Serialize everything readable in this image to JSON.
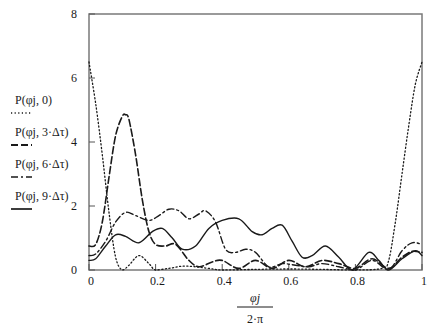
{
  "chart_data": {
    "type": "line",
    "title": "",
    "xlabel_numerator": "φj",
    "xlabel_denominator": "2·π",
    "ylabel": "",
    "xlim": [
      0,
      1
    ],
    "ylim": [
      0,
      8
    ],
    "x_ticks": [
      0,
      0.2,
      0.4,
      0.6,
      0.8,
      1
    ],
    "x_tick_labels": [
      "0",
      "0.2",
      "0.4",
      "0.6",
      "0.8",
      "1"
    ],
    "y_ticks": [
      0,
      2,
      4,
      6,
      8
    ],
    "y_tick_labels": [
      "0",
      "2",
      "4",
      "6",
      "8"
    ],
    "grid": false,
    "legend_position": "left",
    "series": [
      {
        "name": "P(φj, 0)",
        "style": "dotted",
        "x": [
          0,
          0.02,
          0.04,
          0.06,
          0.08,
          0.1,
          0.12,
          0.15,
          0.18,
          0.2,
          0.24,
          0.28,
          0.32,
          0.36,
          0.4,
          0.5,
          0.6,
          0.7,
          0.8,
          0.88,
          0.9,
          0.92,
          0.94,
          0.96,
          0.98,
          1
        ],
        "values": [
          6.5,
          5.2,
          3.6,
          1.8,
          0.4,
          0.0,
          0.15,
          0.45,
          0.2,
          0.0,
          0.05,
          0.12,
          0.1,
          0.05,
          0.0,
          0.02,
          0.03,
          0.02,
          0.0,
          0.05,
          0.3,
          1.5,
          3.0,
          4.5,
          5.8,
          6.5
        ]
      },
      {
        "name": "P(φj, 3·Δτ)",
        "style": "dashed",
        "x": [
          0,
          0.02,
          0.04,
          0.06,
          0.08,
          0.1,
          0.11,
          0.12,
          0.14,
          0.16,
          0.18,
          0.2,
          0.23,
          0.26,
          0.3,
          0.33,
          0.37,
          0.4,
          0.45,
          0.5,
          0.55,
          0.6,
          0.65,
          0.7,
          0.75,
          0.8,
          0.85,
          0.9,
          0.94,
          0.97,
          1
        ],
        "values": [
          0.75,
          0.8,
          1.5,
          2.9,
          4.2,
          4.8,
          4.85,
          4.7,
          3.6,
          2.2,
          1.2,
          0.8,
          0.75,
          0.8,
          0.3,
          0.1,
          0.25,
          0.3,
          0.05,
          0.3,
          0.05,
          0.3,
          0.1,
          0.3,
          0.2,
          0.05,
          0.35,
          0.05,
          0.4,
          0.58,
          0.55
        ]
      },
      {
        "name": "P(φj, 6·Δτ)",
        "style": "dashdot",
        "x": [
          0,
          0.02,
          0.05,
          0.08,
          0.11,
          0.14,
          0.18,
          0.21,
          0.24,
          0.27,
          0.3,
          0.33,
          0.35,
          0.38,
          0.41,
          0.44,
          0.47,
          0.5,
          0.54,
          0.58,
          0.62,
          0.66,
          0.7,
          0.75,
          0.8,
          0.85,
          0.9,
          0.94,
          0.97,
          1
        ],
        "values": [
          0.45,
          0.5,
          0.9,
          1.5,
          1.8,
          1.7,
          1.55,
          1.7,
          1.9,
          1.85,
          1.6,
          1.75,
          1.85,
          1.5,
          0.65,
          0.55,
          0.65,
          0.55,
          0.1,
          0.2,
          0.15,
          0.1,
          0.2,
          0.1,
          0.0,
          0.3,
          0.0,
          0.6,
          0.85,
          0.8
        ]
      },
      {
        "name": "P(φj, 9·Δτ)",
        "style": "solid",
        "x": [
          0,
          0.02,
          0.05,
          0.08,
          0.11,
          0.15,
          0.19,
          0.22,
          0.25,
          0.28,
          0.32,
          0.36,
          0.4,
          0.45,
          0.49,
          0.52,
          0.55,
          0.58,
          0.61,
          0.64,
          0.67,
          0.71,
          0.75,
          0.79,
          0.84,
          0.87,
          0.9,
          0.94,
          0.98,
          1
        ],
        "values": [
          0.3,
          0.35,
          0.75,
          1.1,
          1.05,
          0.85,
          1.2,
          1.3,
          1.0,
          0.65,
          0.75,
          1.3,
          1.55,
          1.6,
          1.2,
          1.1,
          1.3,
          1.4,
          0.9,
          0.4,
          0.45,
          0.75,
          0.4,
          0.0,
          0.55,
          0.3,
          0.0,
          0.35,
          0.6,
          0.45
        ]
      }
    ]
  }
}
